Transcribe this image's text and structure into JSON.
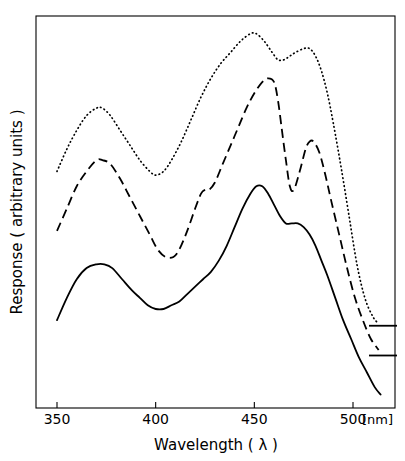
{
  "chart_data": {
    "type": "line",
    "title": "",
    "xlabel": "Wavelength ( λ )",
    "ylabel": "Response ( arbitrary units )",
    "x_unit": "[nm]",
    "xlim": [
      339,
      375
    ],
    "xlim_nm": [
      339,
      375
    ],
    "x_axis_range_nm": [
      339,
      372
    ],
    "xticks": [
      350,
      400,
      450,
      500
    ],
    "xticklabels": [
      "350",
      "400",
      "450",
      "500"
    ],
    "yticks": [],
    "yticklabels": [],
    "ylim": [
      0,
      100
    ],
    "grid": false,
    "legend": "none",
    "series": [
      {
        "name": "dotted-trace",
        "style": "dotted",
        "color": "#000000",
        "x": [
          350,
          355,
          360,
          365,
          370,
          373,
          377,
          382,
          387,
          392,
          397,
          400,
          404,
          408,
          413,
          418,
          423,
          428,
          433,
          438,
          443,
          448,
          451,
          455,
          459,
          462,
          465,
          468,
          471,
          475,
          478,
          481,
          484,
          487,
          490,
          494,
          498,
          502,
          506,
          510,
          513
        ],
        "y": [
          62,
          68,
          73,
          77,
          79,
          79,
          77,
          73,
          69,
          65,
          62,
          61,
          62,
          65,
          70,
          76,
          82,
          87,
          91,
          94,
          97,
          99,
          99,
          97,
          94,
          92,
          92,
          93,
          94,
          95,
          95,
          93,
          89,
          83,
          75,
          63,
          50,
          37,
          28,
          23,
          21
        ]
      },
      {
        "name": "dashed-trace",
        "style": "dashed",
        "color": "#000000",
        "x": [
          350,
          355,
          360,
          365,
          370,
          373,
          377,
          382,
          387,
          392,
          397,
          401,
          405,
          409,
          412,
          416,
          420,
          423,
          425,
          427,
          430,
          434,
          438,
          442,
          446,
          450,
          454,
          457,
          460,
          462,
          464,
          466,
          468,
          470,
          473,
          476,
          478,
          480,
          483,
          486,
          489,
          493,
          497,
          501,
          505,
          509,
          513
        ],
        "y": [
          46,
          52,
          58,
          62,
          65,
          65,
          64,
          60,
          55,
          50,
          45,
          41,
          39,
          39,
          41,
          46,
          52,
          56,
          57,
          57,
          59,
          64,
          69,
          74,
          79,
          83,
          86,
          87,
          86,
          81,
          73,
          65,
          58,
          57,
          62,
          68,
          70,
          70,
          67,
          61,
          54,
          45,
          36,
          28,
          22,
          17,
          14
        ]
      },
      {
        "name": "solid-trace",
        "style": "solid",
        "color": "#000000",
        "x": [
          350,
          355,
          360,
          365,
          370,
          374,
          378,
          383,
          388,
          392,
          396,
          400,
          404,
          408,
          412,
          416,
          420,
          424,
          428,
          432,
          436,
          440,
          444,
          448,
          451,
          454,
          457,
          460,
          463,
          466,
          469,
          472,
          475,
          478,
          481,
          484,
          487,
          491,
          495,
          499,
          503,
          507,
          511,
          514
        ],
        "y": [
          22,
          28,
          33,
          36,
          37,
          37,
          36,
          33,
          30,
          28,
          26,
          25,
          25,
          26,
          27,
          29,
          31,
          33,
          35,
          38,
          42,
          47,
          52,
          56,
          58,
          58,
          56,
          53,
          50,
          48,
          48,
          48,
          47,
          45,
          42,
          38,
          34,
          28,
          22,
          17,
          12,
          8,
          4,
          2
        ]
      }
    ],
    "reference_marks": [
      {
        "name": "dotted-baseline-mark",
        "y_value": 20.5,
        "x_from": 369,
        "x_to": 397
      },
      {
        "name": "dashed-baseline-mark",
        "y_value": 12.5,
        "x_from": 369,
        "x_to": 397
      }
    ]
  },
  "axes": {
    "x_title": "Wavelength ( λ )",
    "x_title_plain": "Wavelength (",
    "x_title_symbol": "λ",
    "x_title_close": ")",
    "y_title": "Response ( arbitrary units )",
    "unit_label": "[nm]",
    "ticks": [
      {
        "label": "350"
      },
      {
        "label": "400"
      },
      {
        "label": "450"
      },
      {
        "label": "500"
      }
    ]
  }
}
